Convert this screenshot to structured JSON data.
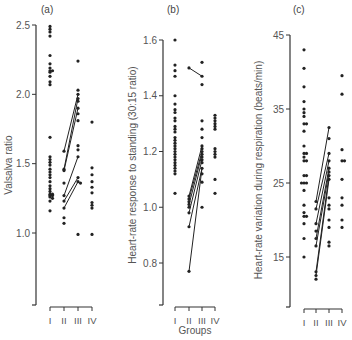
{
  "chart_data": [
    {
      "type": "scatter",
      "panel": "(a)",
      "ylabel": "Valsalva ratio",
      "xlabel": "",
      "categories": [
        "I",
        "II",
        "III",
        "IV"
      ],
      "yticks": [
        1.0,
        1.5,
        2.0,
        2.5
      ],
      "ylim": [
        0.5,
        2.5
      ],
      "series": [
        {
          "name": "I",
          "values": [
            2.49,
            2.47,
            2.45,
            2.42,
            2.28,
            2.22,
            2.19,
            2.17,
            2.17,
            2.16,
            2.13,
            2.09,
            2.07,
            1.69,
            1.55,
            1.53,
            1.51,
            1.49,
            1.46,
            1.44,
            1.42,
            1.4,
            1.37,
            1.34,
            1.32,
            1.3,
            1.28,
            1.28,
            1.27,
            1.27,
            1.26,
            1.25,
            1.23,
            1.16
          ]
        },
        {
          "name": "II",
          "values": [
            1.59,
            1.46,
            1.45,
            1.36,
            1.27,
            1.23,
            1.18,
            1.11,
            1.07
          ]
        },
        {
          "name": "III",
          "values": [
            2.24,
            2.03,
            2.0,
            1.97,
            1.95,
            1.9,
            1.86,
            1.81,
            1.63,
            1.6,
            1.55,
            1.4,
            1.37,
            1.36,
            0.99
          ]
        },
        {
          "name": "IV",
          "values": [
            1.8,
            1.47,
            1.42,
            1.37,
            1.33,
            1.29,
            1.22,
            1.2,
            1.18,
            0.99
          ]
        }
      ],
      "paired_lines": [
        {
          "from": [
            "II",
            1.59
          ],
          "to": [
            "III",
            2.0
          ]
        },
        {
          "from": [
            "II",
            1.46
          ],
          "to": [
            "III",
            1.97
          ]
        },
        {
          "from": [
            "II",
            1.45
          ],
          "to": [
            "III",
            1.9
          ]
        },
        {
          "from": [
            "II",
            1.27
          ],
          "to": [
            "III",
            1.55
          ]
        },
        {
          "from": [
            "II",
            1.23
          ],
          "to": [
            "III",
            1.4
          ]
        },
        {
          "from": [
            "II",
            1.18
          ],
          "to": [
            "III",
            1.37
          ]
        }
      ]
    },
    {
      "type": "scatter",
      "panel": "(b)",
      "ylabel": "Heart-rate response to standing (30:15 ratio)",
      "xlabel": "Groups",
      "categories": [
        "I",
        "II",
        "III",
        "IV"
      ],
      "yticks": [
        0.8,
        1.0,
        1.2,
        1.4,
        1.6
      ],
      "ylim": [
        0.65,
        1.6
      ],
      "series": [
        {
          "name": "I",
          "values": [
            1.6,
            1.51,
            1.49,
            1.47,
            1.4,
            1.37,
            1.35,
            1.34,
            1.32,
            1.31,
            1.29,
            1.28,
            1.27,
            1.25,
            1.24,
            1.23,
            1.22,
            1.21,
            1.2,
            1.19,
            1.18,
            1.17,
            1.16,
            1.15,
            1.14,
            1.13,
            1.12,
            1.05
          ]
        },
        {
          "name": "II",
          "values": [
            1.5,
            1.04,
            1.03,
            1.02,
            1.01,
            1.0,
            0.98,
            0.93,
            0.77
          ]
        },
        {
          "name": "III",
          "values": [
            1.52,
            1.47,
            1.44,
            1.31,
            1.28,
            1.25,
            1.22,
            1.21,
            1.2,
            1.19,
            1.18,
            1.17,
            1.16,
            1.14,
            1.12,
            1.09,
            1.0
          ]
        },
        {
          "name": "IV",
          "values": [
            1.33,
            1.32,
            1.31,
            1.3,
            1.29,
            1.28,
            1.21,
            1.2,
            1.19,
            1.18,
            1.1,
            1.05
          ]
        }
      ],
      "paired_lines": [
        {
          "from": [
            "II",
            1.5
          ],
          "to": [
            "III",
            1.47
          ]
        },
        {
          "from": [
            "II",
            1.04
          ],
          "to": [
            "III",
            1.22
          ]
        },
        {
          "from": [
            "II",
            1.03
          ],
          "to": [
            "III",
            1.2
          ]
        },
        {
          "from": [
            "II",
            1.01
          ],
          "to": [
            "III",
            1.19
          ]
        },
        {
          "from": [
            "II",
            0.98
          ],
          "to": [
            "III",
            1.17
          ]
        },
        {
          "from": [
            "II",
            0.93
          ],
          "to": [
            "III",
            1.14
          ]
        },
        {
          "from": [
            "II",
            0.77
          ],
          "to": [
            "III",
            1.14
          ]
        }
      ]
    },
    {
      "type": "scatter",
      "panel": "(c)",
      "ylabel": "Heart-rate variation during respiration (beats/min)",
      "xlabel": "",
      "categories": [
        "I",
        "II",
        "III",
        "IV"
      ],
      "yticks": [
        15,
        25,
        35,
        45
      ],
      "ylim": [
        9,
        45
      ],
      "series": [
        {
          "name": "I",
          "values": [
            43,
            40.5,
            38,
            36,
            35,
            34.5,
            34,
            33,
            33,
            32,
            30,
            29,
            29,
            28.5,
            28,
            28,
            26,
            26,
            25,
            25,
            25,
            24,
            22,
            21,
            20.5,
            20.5,
            19.5,
            17.5,
            15
          ]
        },
        {
          "name": "II",
          "values": [
            22.5,
            21.5,
            19.5,
            18.5,
            17.5,
            16.5,
            13,
            12.5,
            12
          ]
        },
        {
          "name": "III",
          "values": [
            32.5,
            31,
            29,
            28,
            27,
            26.5,
            26,
            25.5,
            23,
            22,
            21.5,
            20,
            19,
            17,
            16.5
          ]
        },
        {
          "name": "IV",
          "values": [
            39.5,
            37,
            29.5,
            28,
            28,
            25.5,
            23,
            22,
            20,
            19
          ]
        }
      ],
      "paired_lines": [
        {
          "from": [
            "II",
            22.5
          ],
          "to": [
            "III",
            32.5
          ]
        },
        {
          "from": [
            "II",
            21.5
          ],
          "to": [
            "III",
            29
          ]
        },
        {
          "from": [
            "II",
            19.5
          ],
          "to": [
            "III",
            28
          ]
        },
        {
          "from": [
            "II",
            17.5
          ],
          "to": [
            "III",
            27
          ]
        },
        {
          "from": [
            "II",
            16.5
          ],
          "to": [
            "III",
            26.5
          ]
        },
        {
          "from": [
            "II",
            13
          ],
          "to": [
            "III",
            26
          ]
        },
        {
          "from": [
            "II",
            12.5
          ],
          "to": [
            "III",
            25.5
          ]
        }
      ]
    }
  ],
  "labels": {
    "panel_a": "(a)",
    "panel_b": "(b)",
    "panel_c": "(c)",
    "ylabel_a": "Valsalva ratio",
    "ylabel_b": "Heart-rate response to standing (30:15 ratio)",
    "ylabel_c": "Heart-rate variation during respiration (beats/min)",
    "xlabel": "Groups"
  }
}
